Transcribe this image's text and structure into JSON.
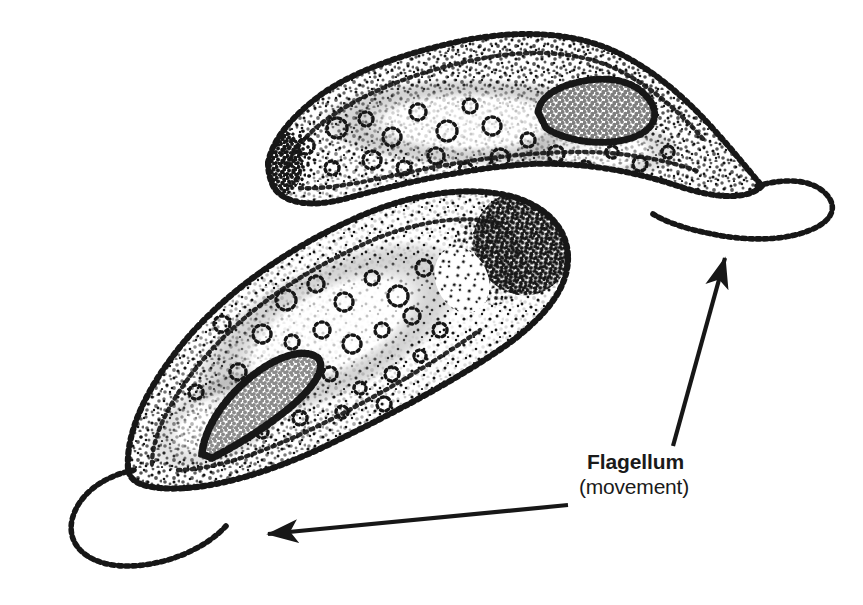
{
  "figure": {
    "kind": "stippled-biology-illustration",
    "background_color": "#ffffff",
    "ink_color": "#171717",
    "width": 863,
    "height": 605,
    "organisms": [
      {
        "name": "upper-protozoan-cell",
        "description": "crescent / banana shaped cell, long axis running lower-left to right",
        "body_outline_points": "268,163 282,122 320,92 370,68 430,48 495,36 555,38 610,52 655,80 692,118 724,150 744,172 760,188 745,200 712,196 672,180 628,166 575,160 520,166 460,180 400,196 345,206 300,200 274,184",
        "dense_tip": {
          "cx": 279,
          "cy": 163,
          "rx": 20,
          "ry": 31
        },
        "vacuole_outline_points": "540,95 575,82 608,80 634,90 650,108 644,128 618,140 585,140 556,130 538,114",
        "flagellum_path": "M 757,186 C 786,178 812,180 826,194 C 838,207 832,222 812,230 C 786,240 748,240 714,234 C 686,229 666,222 653,214"
      },
      {
        "name": "lower-protozoan-cell",
        "description": "elongated ovoid cell tilted from lower-left to upper-right, dense posterior mass at upper right",
        "body_outline_points": "128,466 150,400 190,340 245,288 310,248 380,218 444,202 496,198 538,208 562,230 570,258 556,290 520,326 466,364 398,404 330,440 262,470 196,488 152,486",
        "dense_tip": {
          "cx": 524,
          "cy": 243,
          "rx": 42,
          "ry": 46
        },
        "vacuole_outline_points": "203,452 214,420 238,390 272,366 302,354 318,360 312,378 288,402 254,428 224,448",
        "flagellum_path": "M 134,470 C 104,476 78,494 72,520 C 66,548 92,566 130,566 C 168,566 206,548 226,526"
      }
    ],
    "arrows": [
      {
        "name": "upper-motion-arrow",
        "from": [
          673,
          446
        ],
        "to": [
          727,
          252
        ],
        "head": "end",
        "meaning": "direction of movement of upper cell"
      },
      {
        "name": "lower-motion-arrow",
        "from": [
          568,
          505
        ],
        "to": [
          259,
          535
        ],
        "head": "end",
        "meaning": "direction of movement of lower cell"
      }
    ]
  },
  "labels": {
    "flagellum": {
      "title": "Flagellum",
      "subtitle": "(movement)"
    }
  }
}
